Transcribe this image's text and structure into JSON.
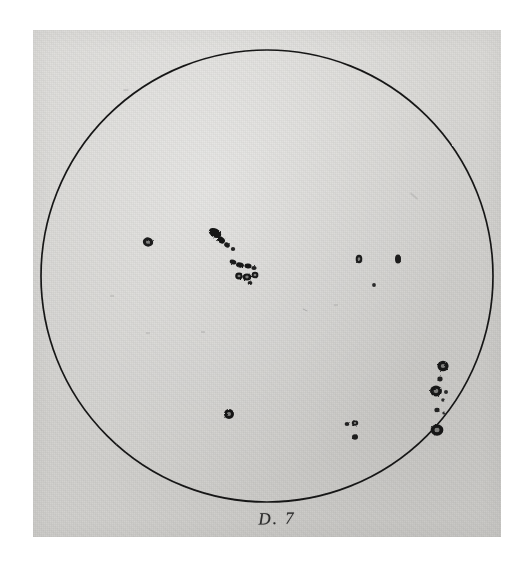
{
  "plate": {
    "title": "Sunspot disk drawing",
    "caption": "D. 7",
    "medium": "pen and ink on paper",
    "background_color": "#ffffff",
    "paper_color": "#d6d5d2",
    "ink_color": "#171717"
  },
  "paper": {
    "left": 33,
    "top": 30,
    "width": 468,
    "height": 507
  },
  "disk": {
    "label": "solar-disk",
    "center_x": 267,
    "center_y": 276,
    "radius": 226,
    "stroke_color": "#171717",
    "stroke_width": 1.7
  },
  "chart_data": {
    "type": "scatter",
    "title": "D. 7",
    "subtitle": "Hand drawn solar disk with sunspot groups",
    "xlabel": "",
    "ylabel": "",
    "xlim": [
      -1,
      1
    ],
    "ylim": [
      -1,
      1
    ],
    "grid": false,
    "legend": "none",
    "annotations": [
      "D. 7"
    ],
    "groups": [
      {
        "name": "west-isolated-spot",
        "description": "single small round spot with penumbra left of centre",
        "spots": [
          {
            "cx": 148,
            "cy": 242,
            "rx": 5.2,
            "ry": 4.6,
            "rot": 10,
            "fill": "#1b1b1b",
            "core": true
          }
        ]
      },
      {
        "name": "central-upper-group",
        "description": "elongated dark group tilted south-east",
        "spots": [
          {
            "cx": 215,
            "cy": 233,
            "rx": 6.6,
            "ry": 4.4,
            "rot": 28,
            "fill": "#131313",
            "core": false
          },
          {
            "cx": 221,
            "cy": 240,
            "rx": 4.2,
            "ry": 3.2,
            "rot": 35,
            "fill": "#171717",
            "core": false
          },
          {
            "cx": 227,
            "cy": 245,
            "rx": 3.0,
            "ry": 2.4,
            "rot": 35,
            "fill": "#1d1d1d",
            "core": false
          },
          {
            "cx": 233,
            "cy": 249,
            "rx": 2.2,
            "ry": 1.9,
            "rot": 0,
            "fill": "#262626",
            "core": false
          }
        ]
      },
      {
        "name": "central-lower-group",
        "description": "complex cluster of merged umbrae",
        "spots": [
          {
            "cx": 233,
            "cy": 262,
            "rx": 3.4,
            "ry": 2.3,
            "rot": 20,
            "fill": "#1a1a1a",
            "core": false
          },
          {
            "cx": 240,
            "cy": 265,
            "rx": 4.0,
            "ry": 2.6,
            "rot": 15,
            "fill": "#141414",
            "core": false
          },
          {
            "cx": 248,
            "cy": 266,
            "rx": 3.6,
            "ry": 2.4,
            "rot": 8,
            "fill": "#161616",
            "core": false
          },
          {
            "cx": 254,
            "cy": 268,
            "rx": 2.6,
            "ry": 2.1,
            "rot": 0,
            "fill": "#202020",
            "core": false
          },
          {
            "cx": 239,
            "cy": 276,
            "rx": 3.8,
            "ry": 3.4,
            "rot": 0,
            "fill": "#161616",
            "core": true
          },
          {
            "cx": 247,
            "cy": 277,
            "rx": 4.2,
            "ry": 3.6,
            "rot": 0,
            "fill": "#131313",
            "core": true
          },
          {
            "cx": 255,
            "cy": 275,
            "rx": 3.4,
            "ry": 3.2,
            "rot": 0,
            "fill": "#1a1a1a",
            "core": true
          },
          {
            "cx": 250,
            "cy": 283,
            "rx": 2.4,
            "ry": 2.0,
            "rot": 0,
            "fill": "#242424",
            "core": false
          }
        ]
      },
      {
        "name": "east-pair-upper",
        "description": "two small spots right of centre",
        "spots": [
          {
            "cx": 359,
            "cy": 259,
            "rx": 3.3,
            "ry": 4.3,
            "rot": 0,
            "fill": "#1c1c1c",
            "core": true
          },
          {
            "cx": 398,
            "cy": 259,
            "rx": 3.0,
            "ry": 4.6,
            "rot": 0,
            "fill": "#1a1a1a",
            "core": true
          },
          {
            "cx": 374,
            "cy": 285,
            "rx": 1.9,
            "ry": 1.9,
            "rot": 0,
            "fill": "#2a2a2a",
            "core": false
          }
        ]
      },
      {
        "name": "south-central-spot",
        "description": "D shaped spot below centre",
        "spots": [
          {
            "cx": 229,
            "cy": 414,
            "rx": 5.0,
            "ry": 5.0,
            "rot": 0,
            "fill": "#191919",
            "core": true
          }
        ]
      },
      {
        "name": "south-east-small-group",
        "description": "small pair with one spot beneath",
        "spots": [
          {
            "cx": 347,
            "cy": 424,
            "rx": 2.4,
            "ry": 2.0,
            "rot": 0,
            "fill": "#232323",
            "core": false
          },
          {
            "cx": 355,
            "cy": 423,
            "rx": 3.2,
            "ry": 2.8,
            "rot": 0,
            "fill": "#1a1a1a",
            "core": true
          },
          {
            "cx": 355,
            "cy": 437,
            "rx": 3.0,
            "ry": 2.8,
            "rot": 0,
            "fill": "#1d1d1d",
            "core": true
          }
        ]
      },
      {
        "name": "east-limb-chain",
        "description": "vertical chain of granular spots near the eastern limb",
        "spots": [
          {
            "cx": 443,
            "cy": 366,
            "rx": 5.6,
            "ry": 5.2,
            "rot": 0,
            "fill": "#161616",
            "core": true
          },
          {
            "cx": 440,
            "cy": 379,
            "rx": 2.6,
            "ry": 2.4,
            "rot": 0,
            "fill": "#202020",
            "core": false
          },
          {
            "cx": 436,
            "cy": 391,
            "rx": 6.0,
            "ry": 5.4,
            "rot": 0,
            "fill": "#151515",
            "core": true
          },
          {
            "cx": 446,
            "cy": 392,
            "rx": 2.0,
            "ry": 1.9,
            "rot": 0,
            "fill": "#2b2b2b",
            "core": false
          },
          {
            "cx": 443,
            "cy": 400,
            "rx": 1.8,
            "ry": 1.7,
            "rot": 0,
            "fill": "#2e2e2e",
            "core": false
          },
          {
            "cx": 437,
            "cy": 410,
            "rx": 2.6,
            "ry": 2.3,
            "rot": 0,
            "fill": "#212121",
            "core": false
          },
          {
            "cx": 444,
            "cy": 413,
            "rx": 1.7,
            "ry": 1.6,
            "rot": 0,
            "fill": "#303030",
            "core": false
          },
          {
            "cx": 437,
            "cy": 430,
            "rx": 6.4,
            "ry": 5.8,
            "rot": 0,
            "fill": "#161616",
            "core": true
          }
        ]
      }
    ],
    "faint_marks": [
      {
        "cx": 414,
        "cy": 196,
        "len": 9,
        "rot": 40
      },
      {
        "cx": 126,
        "cy": 90,
        "len": 5,
        "rot": 0
      },
      {
        "cx": 148,
        "cy": 333,
        "len": 4,
        "rot": 0
      },
      {
        "cx": 305,
        "cy": 310,
        "len": 5,
        "rot": 25
      },
      {
        "cx": 203,
        "cy": 332,
        "len": 4,
        "rot": 0
      },
      {
        "cx": 336,
        "cy": 305,
        "len": 4,
        "rot": 0
      },
      {
        "cx": 112,
        "cy": 296,
        "len": 4,
        "rot": 0
      }
    ]
  }
}
